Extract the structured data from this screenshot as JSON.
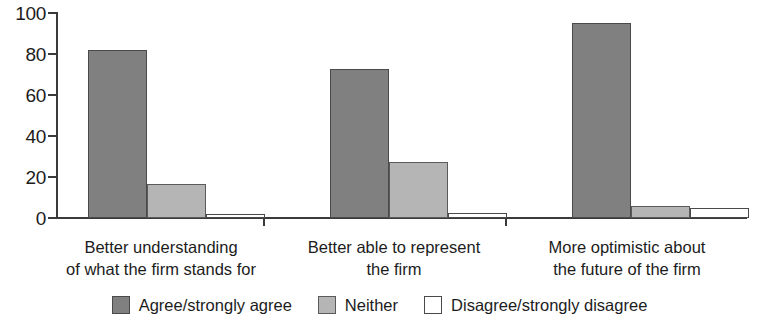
{
  "chart_data": {
    "type": "bar",
    "title": "",
    "subtitle": "",
    "xlabel": "",
    "ylabel": "",
    "ylim": [
      0,
      100
    ],
    "yticks": [
      0,
      20,
      40,
      60,
      80,
      100
    ],
    "ytick_labels": [
      "0",
      "20",
      "40",
      "60",
      "80",
      "100"
    ],
    "grid": false,
    "legend_position": "bottom",
    "categories": [
      "Better understanding\nof what the firm stands for",
      "Better able to represent\nthe firm",
      "More optimistic about\nthe future of the firm"
    ],
    "category_lines": [
      [
        "Better understanding",
        "of what the firm stands for"
      ],
      [
        "Better able to represent",
        "the firm"
      ],
      [
        "More optimistic about",
        "the future of the firm"
      ]
    ],
    "series": [
      {
        "name": "Agree/strongly agree",
        "color": "#808080",
        "edge_color": "#4a4a4a",
        "values": [
          82,
          72.5,
          95
        ]
      },
      {
        "name": "Neither",
        "color": "#b5b5b5",
        "edge_color": "#5a5a5a",
        "values": [
          16.5,
          27.5,
          6
        ]
      },
      {
        "name": "Disagree/strongly disagree",
        "color": "#ffffff",
        "edge_color": "#4a4a4a",
        "values": [
          2,
          2.5,
          5
        ]
      }
    ]
  },
  "axis": {
    "tick_0": "0",
    "tick_20": "20",
    "tick_40": "40",
    "tick_60": "60",
    "tick_80": "80",
    "tick_100": "100"
  },
  "categories": {
    "g0_l0": "Better understanding",
    "g0_l1": "of what the firm stands for",
    "g1_l0": "Better able to represent",
    "g1_l1": "the firm",
    "g2_l0": "More optimistic about",
    "g2_l1": "the future of the firm"
  },
  "legend": {
    "item0": "Agree/strongly agree",
    "item1": "Neither",
    "item2": "Disagree/strongly disagree"
  }
}
